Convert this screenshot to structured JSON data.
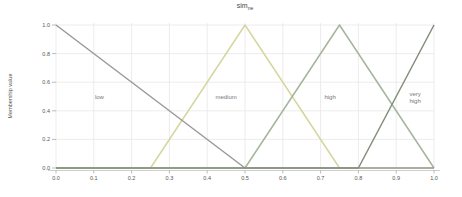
{
  "figure": {
    "title_base": "sim",
    "title_sub": "ne",
    "ylabel": "Membership value"
  },
  "chart_data": {
    "type": "line",
    "xlabel": "",
    "ylabel": "Membership value",
    "xlim": [
      0,
      1
    ],
    "ylim": [
      0,
      1
    ],
    "grid": true,
    "legend_position": "none (inline annotations)",
    "x_tick_labels": [
      "0.0",
      "0.1",
      "0.2",
      "0.3",
      "0.4",
      "0.5",
      "0.6",
      "0.7",
      "0.8",
      "0.9",
      "1.0"
    ],
    "y_tick_labels": [
      "0.0",
      "0.2",
      "0.4",
      "0.6",
      "0.8",
      "1.0"
    ],
    "colors": {
      "grid": "#e7e7e7",
      "axis": "#cfcfcf",
      "tick": "#aaaaaa",
      "tick_text": "#555555",
      "annotation": "#777777"
    },
    "series": [
      {
        "name": "low",
        "label": "low",
        "color": "#9a9a9a",
        "z": 2,
        "points": [
          [
            0,
            1
          ],
          [
            0.5,
            0
          ],
          [
            1,
            0
          ]
        ],
        "label_pos": [
          0.115,
          0.5
        ]
      },
      {
        "name": "medium",
        "label": "medium",
        "color": "#d6d6a0",
        "z": 0,
        "points": [
          [
            0,
            0
          ],
          [
            0.25,
            0
          ],
          [
            0.5,
            1
          ],
          [
            0.75,
            0
          ],
          [
            1,
            0
          ]
        ],
        "label_pos": [
          0.45,
          0.5
        ]
      },
      {
        "name": "high",
        "label": "high",
        "color": "#a5b49c",
        "z": 1,
        "points": [
          [
            0,
            0
          ],
          [
            0.5,
            0
          ],
          [
            0.75,
            1
          ],
          [
            1,
            0
          ]
        ],
        "label_pos": [
          0.725,
          0.5
        ]
      },
      {
        "name": "very high",
        "label": "very high",
        "color": "#838f7a",
        "z": 3,
        "points": [
          [
            0,
            0
          ],
          [
            0.8,
            0
          ],
          [
            1,
            1
          ]
        ],
        "label_pos": [
          0.95,
          0.49
        ]
      }
    ]
  }
}
